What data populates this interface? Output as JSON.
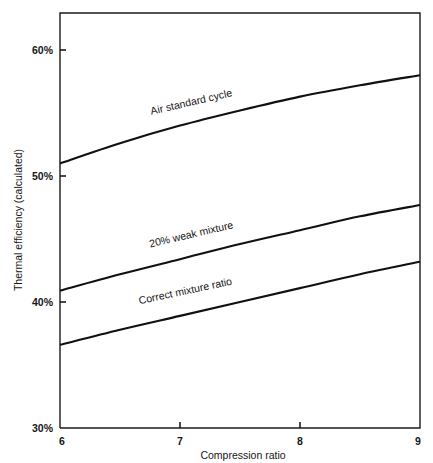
{
  "chart_data": {
    "type": "line",
    "title": "",
    "xlabel": "Compression ratio",
    "ylabel": "Thermal efficiency (calculated)",
    "xlim": [
      6,
      9
    ],
    "ylim": [
      30,
      60
    ],
    "xticks": [
      "6",
      "7",
      "8",
      "9"
    ],
    "xtick_values": [
      6,
      7,
      8,
      9
    ],
    "yticks": [
      "30%",
      "40%",
      "50%",
      "60%"
    ],
    "ytick_values": [
      30,
      40,
      50,
      60
    ],
    "grid": false,
    "legend": "inline-curve-labels",
    "x": [
      6,
      6.5,
      7,
      7.5,
      8,
      8.5,
      9
    ],
    "series": [
      {
        "name": "Air standard cycle",
        "label": "Air standard cycle",
        "values": [
          51.0,
          52.6,
          54.0,
          55.2,
          56.3,
          57.2,
          58.0
        ],
        "label_x": 7.1,
        "label_y": 55.6,
        "label_rotation": -13
      },
      {
        "name": "20% weak mixture",
        "label": "20% weak mixture",
        "values": [
          40.9,
          42.2,
          43.4,
          44.6,
          45.7,
          46.8,
          47.7
        ],
        "label_x": 7.1,
        "label_y": 45.1,
        "label_rotation": -13
      },
      {
        "name": "Correct mixture ratio",
        "label": "Correct mixture ratio",
        "values": [
          36.6,
          37.8,
          38.9,
          40.0,
          41.1,
          42.2,
          43.2
        ],
        "label_x": 7.05,
        "label_y": 40.6,
        "label_rotation": -12
      }
    ],
    "colors": {
      "curve": "#101010",
      "axis": "#1b1b1b",
      "background": "#ffffff"
    }
  }
}
